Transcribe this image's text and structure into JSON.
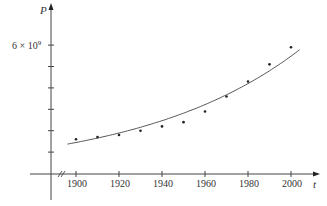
{
  "chart_data": {
    "type": "scatter",
    "title": "",
    "xlabel": "t",
    "ylabel": "P",
    "x_ticks": [
      1900,
      1920,
      1940,
      1960,
      1980,
      2000
    ],
    "x_tick_labels": [
      "1900",
      "1920",
      "1940",
      "1960",
      "1980",
      "2000"
    ],
    "y_ticks": [
      1000000000.0,
      2000000000.0,
      3000000000.0,
      4000000000.0,
      5000000000.0,
      6000000000.0
    ],
    "y_tick_labels": [
      "",
      "",
      "",
      "",
      "",
      "6 × 10⁹"
    ],
    "xlim": [
      1880,
      2010
    ],
    "ylim": [
      0,
      7900000000.0
    ],
    "grid": false,
    "legend": null,
    "axis_break": "x-axis break marks (//) near origin",
    "series": [
      {
        "name": "data points",
        "kind": "scatter",
        "x": [
          1900,
          1910,
          1920,
          1930,
          1940,
          1950,
          1960,
          1970,
          1980,
          1990,
          2000
        ],
        "y": [
          1600000000.0,
          1700000000.0,
          1800000000.0,
          2000000000.0,
          2200000000.0,
          2400000000.0,
          2900000000.0,
          3600000000.0,
          4300000000.0,
          5100000000.0,
          5900000000.0
        ]
      },
      {
        "name": "exponential fit",
        "kind": "line",
        "x": [
          1896,
          1910,
          1920,
          1930,
          1940,
          1950,
          1960,
          1970,
          1980,
          1990,
          2003
        ],
        "y": [
          1360000000.0,
          1560000000.0,
          1730000000.0,
          1930000000.0,
          2150000000.0,
          2400000000.0,
          2700000000.0,
          3050000000.0,
          3450000000.0,
          3950000000.0,
          5800000000.0
        ]
      }
    ]
  },
  "labels": {
    "y_axis": "P",
    "x_axis": "t",
    "y_tick_6": "6 × 10",
    "y_tick_6_exp": "9",
    "x_1900": "1900",
    "x_1920": "1920",
    "x_1940": "1940",
    "x_1960": "1960",
    "x_1980": "1980",
    "x_2000": "2000"
  }
}
